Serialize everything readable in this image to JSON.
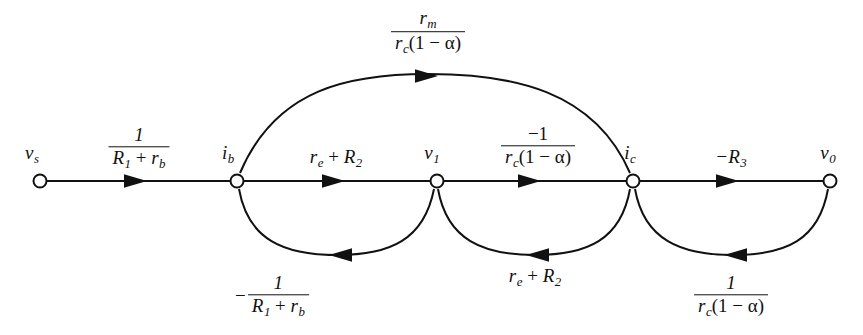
{
  "figure": {
    "kind": "signal-flow-graph",
    "background_color": "#ffffff",
    "stroke_color": "#111111"
  },
  "nodes": [
    {
      "id": "vs",
      "label_main": "v",
      "label_sub": "s",
      "x": 40,
      "y": 181
    },
    {
      "id": "ib",
      "label_main": "i",
      "label_sub": "b",
      "x": 237,
      "y": 181
    },
    {
      "id": "v1",
      "label_main": "v",
      "label_sub": "1",
      "x": 437,
      "y": 181
    },
    {
      "id": "ic",
      "label_main": "i",
      "label_sub": "c",
      "x": 633,
      "y": 181
    },
    {
      "id": "v0",
      "label_main": "v",
      "label_sub": "0",
      "x": 830,
      "y": 181
    }
  ],
  "edges": {
    "forward_vs_ib": {
      "from": "vs",
      "to": "ib",
      "label_type": "fraction",
      "numerator": "1",
      "denominator_parts": [
        {
          "text": "R",
          "sub": "1"
        },
        {
          "text": " + ",
          "sub": ""
        },
        {
          "text": "r",
          "sub": "b"
        }
      ],
      "label_x": 139,
      "label_y": 148
    },
    "forward_ib_v1": {
      "from": "ib",
      "to": "v1",
      "label_type": "plain",
      "label_parts": [
        {
          "text": "r",
          "sub": "e"
        },
        {
          "text": " + ",
          "sub": ""
        },
        {
          "text": "R",
          "sub": "2"
        }
      ],
      "label_x": 336,
      "label_y": 158
    },
    "forward_v1_ic": {
      "from": "v1",
      "to": "ic",
      "label_type": "fraction",
      "numerator": "−1",
      "denominator_parts": [
        {
          "text": "r",
          "sub": "c"
        },
        {
          "text": "(1 − α)",
          "sub": ""
        }
      ],
      "label_x": 538,
      "label_y": 147
    },
    "forward_ic_v0": {
      "from": "ic",
      "to": "v0",
      "label_type": "plain",
      "label_parts": [
        {
          "text": "−R",
          "sub": "3"
        }
      ],
      "label_x": 731,
      "label_y": 158
    },
    "top_arc_ib_ic": {
      "from": "ib",
      "to": "ic",
      "label_type": "fraction",
      "numerator_parts": [
        {
          "text": "r",
          "sub": "m"
        }
      ],
      "denominator_parts": [
        {
          "text": "r",
          "sub": "c"
        },
        {
          "text": "(1 − α)",
          "sub": ""
        }
      ],
      "label_x": 428,
      "label_y": 32
    },
    "bottom_arc_v1_ib": {
      "from": "v1",
      "to": "ib",
      "label_type": "signed-fraction",
      "lead": "−",
      "numerator": "1",
      "denominator_parts": [
        {
          "text": "R",
          "sub": "1"
        },
        {
          "text": " + ",
          "sub": ""
        },
        {
          "text": "r",
          "sub": "b"
        }
      ],
      "label_x": 272,
      "label_y": 296
    },
    "bottom_arc_ic_v1": {
      "from": "ic",
      "to": "v1",
      "label_type": "plain",
      "label_parts": [
        {
          "text": "r",
          "sub": "e"
        },
        {
          "text": " + ",
          "sub": ""
        },
        {
          "text": "R",
          "sub": "2"
        }
      ],
      "label_x": 535,
      "label_y": 277
    },
    "bottom_arc_v0_ic": {
      "from": "v0",
      "to": "ic",
      "label_type": "fraction",
      "numerator": "1",
      "denominator_parts": [
        {
          "text": "r",
          "sub": "c"
        },
        {
          "text": "(1 − α)",
          "sub": ""
        }
      ],
      "label_x": 731,
      "label_y": 296
    }
  }
}
